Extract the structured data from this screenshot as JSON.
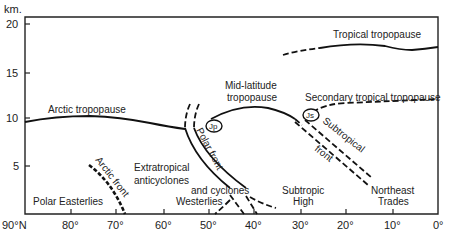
{
  "diagram": {
    "y_axis": {
      "unit": "km.",
      "ticks": [
        {
          "label": "20",
          "y": 24
        },
        {
          "label": "15",
          "y": 73
        },
        {
          "label": "10",
          "y": 118
        },
        {
          "label": "5",
          "y": 166
        }
      ]
    },
    "x_axis": {
      "ticks": [
        {
          "label": "90°N",
          "x": 25
        },
        {
          "label": "80°",
          "x": 71
        },
        {
          "label": "70°",
          "x": 116
        },
        {
          "label": "60°",
          "x": 164
        },
        {
          "label": "50°",
          "x": 209
        },
        {
          "label": "40°",
          "x": 254
        },
        {
          "label": "30°",
          "x": 301
        },
        {
          "label": "20°",
          "x": 346
        },
        {
          "label": "10°",
          "x": 393
        },
        {
          "label": "0°",
          "x": 438
        }
      ]
    },
    "labels": {
      "tropical_tropopause": "Tropical tropopause",
      "arctic_tropopause": "Arctic tropopause",
      "mid_latitude_1": "Mid-latitude",
      "mid_latitude_2": "tropopause",
      "secondary_tropical": "Secondary tropical tropopause",
      "polar_front": "Polar front",
      "subtropical": "Subtropical",
      "front": "front",
      "arctic_front": "Arctic front",
      "extratropical_1": "Extratropical",
      "extratropical_2": "anticyclones",
      "and_cyclones": "and cyclones",
      "westerlies": "Westerlies",
      "polar_easterlies": "Polar Easterlies",
      "subtropic_1": "Subtropic",
      "subtropic_2": "High",
      "northeast_1": "Northeast",
      "northeast_2": "Trades",
      "jet_polar": "Jp",
      "jet_subtropical": "Js"
    }
  }
}
